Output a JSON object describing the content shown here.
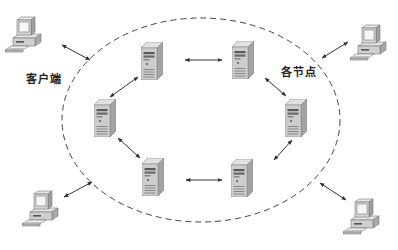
{
  "diagram": {
    "labels": {
      "client": "客户端",
      "nodes": "各节点"
    },
    "boundary": {
      "shape": "ellipse",
      "style": "dashed",
      "cx": 201,
      "cy": 120,
      "rx": 139,
      "ry": 102
    },
    "nodes": [
      {
        "id": "server-top-left",
        "type": "server",
        "x": 141,
        "y": 42
      },
      {
        "id": "server-top-right",
        "type": "server",
        "x": 232,
        "y": 41
      },
      {
        "id": "server-right",
        "type": "server",
        "x": 285,
        "y": 99
      },
      {
        "id": "server-bottom-right",
        "type": "server",
        "x": 231,
        "y": 159
      },
      {
        "id": "server-bottom-left",
        "type": "server",
        "x": 142,
        "y": 158
      },
      {
        "id": "server-left",
        "type": "server",
        "x": 94,
        "y": 99
      }
    ],
    "clients": [
      {
        "id": "client-top-left",
        "type": "workstation",
        "x": 5,
        "y": 16
      },
      {
        "id": "client-top-right",
        "type": "workstation",
        "x": 350,
        "y": 24
      },
      {
        "id": "client-bottom-left",
        "type": "workstation",
        "x": 22,
        "y": 190
      },
      {
        "id": "client-bottom-right",
        "type": "workstation",
        "x": 343,
        "y": 198
      }
    ],
    "edges": [
      {
        "from": "server-top-left",
        "to": "server-top-right",
        "x1": 185,
        "y1": 60,
        "x2": 222,
        "y2": 60
      },
      {
        "from": "server-top-right",
        "to": "server-right",
        "x1": 265,
        "y1": 78,
        "x2": 286,
        "y2": 96
      },
      {
        "from": "server-right",
        "to": "server-bottom-right",
        "x1": 292,
        "y1": 140,
        "x2": 274,
        "y2": 160
      },
      {
        "from": "server-bottom-right",
        "to": "server-bottom-left",
        "x1": 222,
        "y1": 180,
        "x2": 186,
        "y2": 180
      },
      {
        "from": "server-bottom-left",
        "to": "server-left",
        "x1": 140,
        "y1": 158,
        "x2": 118,
        "y2": 138
      },
      {
        "from": "server-left",
        "to": "server-top-left",
        "x1": 110,
        "y1": 97,
        "x2": 138,
        "y2": 77
      },
      {
        "from": "client-top-left",
        "to": "network",
        "x1": 62,
        "y1": 45,
        "x2": 90,
        "y2": 60
      },
      {
        "from": "client-top-right",
        "to": "network",
        "x1": 348,
        "y1": 42,
        "x2": 322,
        "y2": 58
      },
      {
        "from": "client-bottom-left",
        "to": "network",
        "x1": 64,
        "y1": 197,
        "x2": 92,
        "y2": 182
      },
      {
        "from": "client-bottom-right",
        "to": "network",
        "x1": 320,
        "y1": 183,
        "x2": 346,
        "y2": 200
      }
    ],
    "colors": {
      "background": "#ffffff",
      "line": "#333333",
      "server_front": "#c9c9c9",
      "server_side": "#9e9e9e",
      "server_top": "#e0e0e0",
      "monitor": "#d8d8d8",
      "screen": "#f4f4f4"
    }
  }
}
